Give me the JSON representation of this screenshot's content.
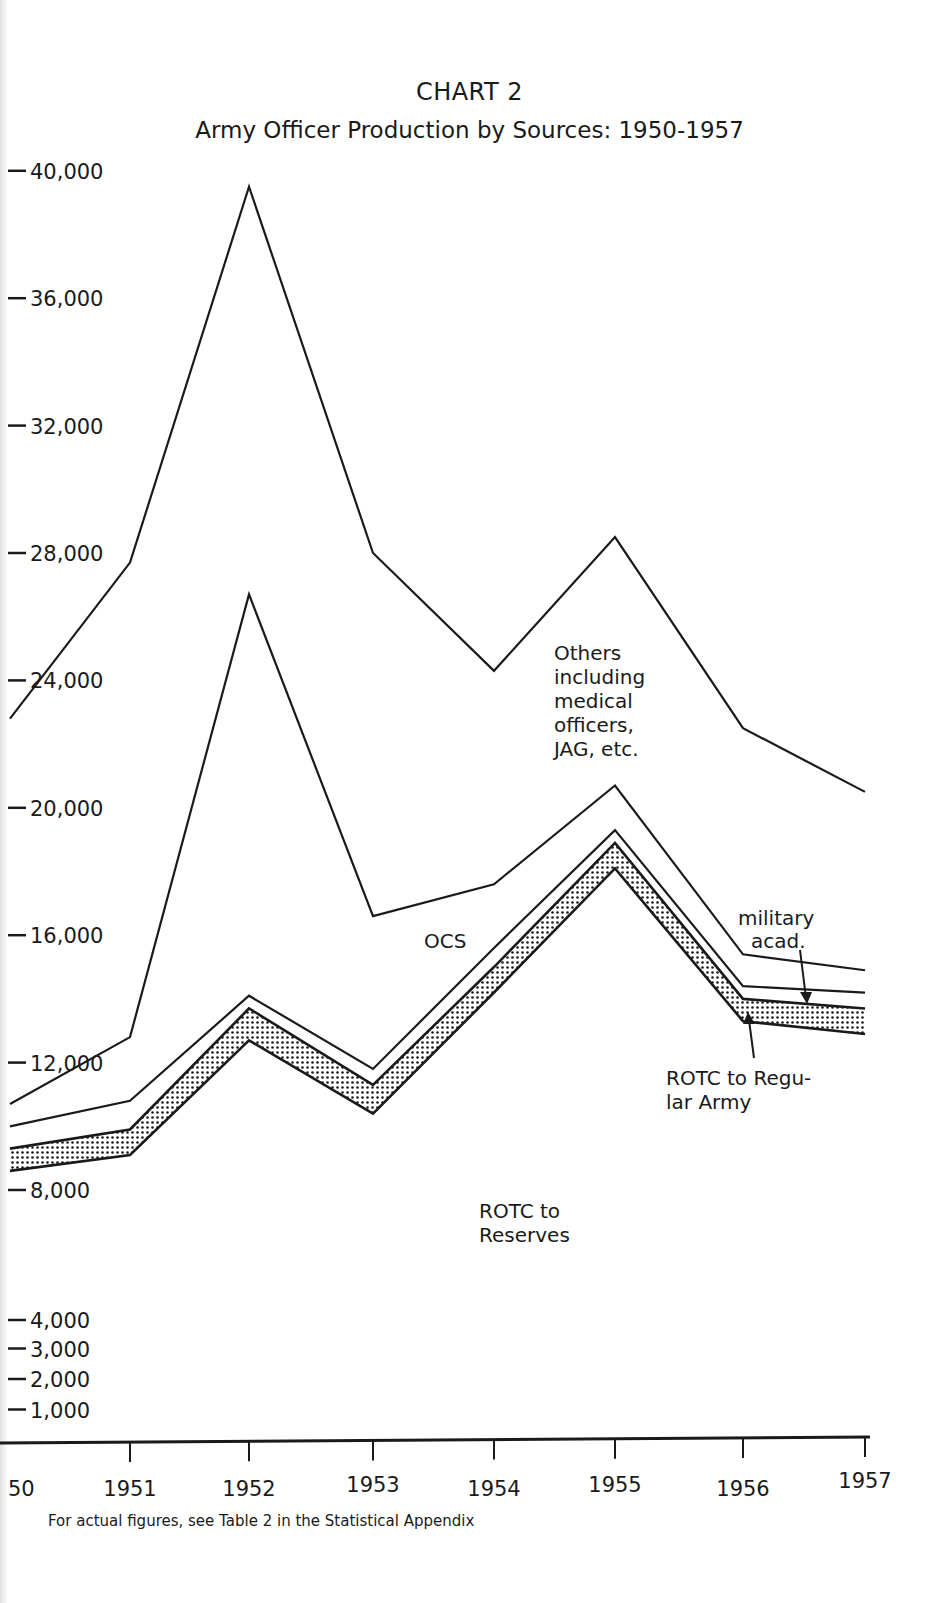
{
  "header": {
    "title": "CHART 2",
    "subtitle": "Army Officer Production by Sources: 1950-1957"
  },
  "footnote": "For actual figures, see Table 2 in the Statistical Appendix",
  "colors": {
    "line": "#1a1a1a",
    "background": "#ffffff",
    "stipple": "#1a1a1a"
  },
  "chart_data": {
    "type": "area",
    "stacked": true,
    "xlabel": "",
    "ylabel": "",
    "x": [
      "1950",
      "1951",
      "1952",
      "1953",
      "1954",
      "1955",
      "1956",
      "1957"
    ],
    "x_tick_labels": [
      "50",
      "1951",
      "1952",
      "1953",
      "1954",
      "1955",
      "1956",
      "1957"
    ],
    "y_tick_labels": [
      "40,000",
      "36,000",
      "32,000",
      "28,000",
      "24,000",
      "20,000",
      "16,000",
      "12,000",
      "8,000",
      "4,000",
      "3,000",
      "2,000",
      "1,000"
    ],
    "y_tick_values": [
      40000,
      36000,
      32000,
      28000,
      24000,
      20000,
      16000,
      12000,
      8000,
      4000,
      3000,
      2000,
      1000
    ],
    "ylim": [
      0,
      40000
    ],
    "grid": false,
    "legend": "inline annotations",
    "cumulative_series": [
      {
        "name": "ROTC to Reserves",
        "fill": "none",
        "values": [
          8600,
          9100,
          12700,
          10400,
          14200,
          18100,
          13300,
          12900
        ]
      },
      {
        "name": "ROTC to Regular Army",
        "fill": "stipple",
        "values": [
          9300,
          9900,
          13700,
          11300,
          15000,
          18900,
          14000,
          13700
        ]
      },
      {
        "name": "military acad.",
        "fill": "none",
        "values": [
          10000,
          10800,
          14100,
          11800,
          15600,
          19300,
          14400,
          14200
        ]
      },
      {
        "name": "OCS",
        "fill": "none",
        "values": [
          10700,
          12800,
          26700,
          16600,
          17600,
          20700,
          15400,
          14900
        ]
      },
      {
        "name": "Others including medical officers, JAG, etc.",
        "fill": "none",
        "values": [
          22800,
          27700,
          39500,
          28000,
          24300,
          28500,
          22500,
          20500
        ]
      }
    ],
    "series": [
      {
        "name": "ROTC to Reserves",
        "values": [
          8600,
          9100,
          12700,
          10400,
          14200,
          18100,
          13300,
          12900
        ]
      },
      {
        "name": "ROTC to Regular Army",
        "values": [
          700,
          800,
          1000,
          900,
          800,
          800,
          700,
          800
        ]
      },
      {
        "name": "military acad.",
        "values": [
          700,
          900,
          400,
          500,
          600,
          400,
          400,
          500
        ]
      },
      {
        "name": "OCS",
        "values": [
          700,
          2000,
          12600,
          4800,
          2000,
          1400,
          1000,
          700
        ]
      },
      {
        "name": "Others including medical officers, JAG, etc.",
        "values": [
          12100,
          14900,
          12800,
          11400,
          6700,
          7800,
          7100,
          5600
        ]
      }
    ],
    "annotations": [
      "Others including medical officers, JAG, etc.",
      "OCS",
      "military acad.",
      "ROTC to Regular Army",
      "ROTC to Reserves"
    ]
  },
  "annotations": {
    "others": [
      "Others",
      "including",
      "medical",
      "officers,",
      "JAG, etc."
    ],
    "ocs": "OCS",
    "military": [
      "military",
      "acad."
    ],
    "rotc_ra": [
      "ROTC to Regu-",
      "lar Army"
    ],
    "rotc_res": [
      "ROTC to",
      "Reserves"
    ]
  }
}
